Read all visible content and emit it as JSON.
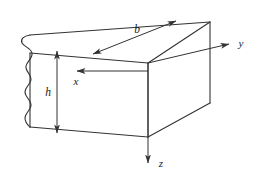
{
  "figure": {
    "background_color": "#ffffff",
    "line_color": "#333333",
    "text_color": "#1a1a1a"
  },
  "dimensions": {
    "width_label": "b",
    "height_label": "h"
  },
  "axes": {
    "x_label": "x",
    "y_label": "y",
    "z_label": "z"
  },
  "annotations": {
    "break_line": "wavy-break-line"
  }
}
